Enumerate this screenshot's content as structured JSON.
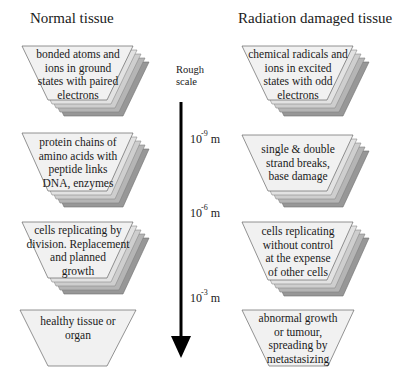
{
  "headings": {
    "left": "Normal tissue",
    "right": "Radiation damaged tissue"
  },
  "scale": {
    "label_line1": "Rough",
    "label_line2": "scale",
    "ticks": [
      {
        "base": "10",
        "exponent": "-9",
        "unit": "m"
      },
      {
        "base": "10",
        "exponent": "-6",
        "unit": "m"
      },
      {
        "base": "10",
        "exponent": "-3",
        "unit": "m"
      }
    ],
    "arrow_direction": "down"
  },
  "normal": [
    {
      "lines": [
        "bonded atoms and",
        "ions in ground",
        "states with paired",
        "electrons"
      ],
      "stacked": true
    },
    {
      "lines": [
        "protein chains of",
        "amino acids with",
        "peptide links",
        "DNA, enzymes"
      ],
      "stacked": true
    },
    {
      "lines": [
        "cells replicating by",
        "division. Replacement",
        "and planned",
        "growth"
      ],
      "stacked": true
    },
    {
      "lines": [
        "healthy tissue or",
        "organ"
      ],
      "stacked": false
    }
  ],
  "damaged": [
    {
      "lines": [
        "chemical radicals and",
        "ions in excited",
        "states with odd",
        "electrons"
      ],
      "stacked": true
    },
    {
      "lines": [
        "single & double",
        "strand breaks,",
        "base damage"
      ],
      "stacked": true
    },
    {
      "lines": [
        "cells replicating",
        "without control",
        "at the expense",
        "of other cells"
      ],
      "stacked": true
    },
    {
      "lines": [
        "abnormal growth",
        "or tumour,",
        "spreading by",
        "metastasizing"
      ],
      "stacked": false
    }
  ],
  "colors": {
    "layer_front": "#f1f1f1",
    "layer_2": "#e2e2e2",
    "layer_3": "#cecece",
    "layer_4": "#b5b5b5",
    "layer_5": "#979797",
    "outline": "#555555",
    "arrow": "#000000"
  }
}
